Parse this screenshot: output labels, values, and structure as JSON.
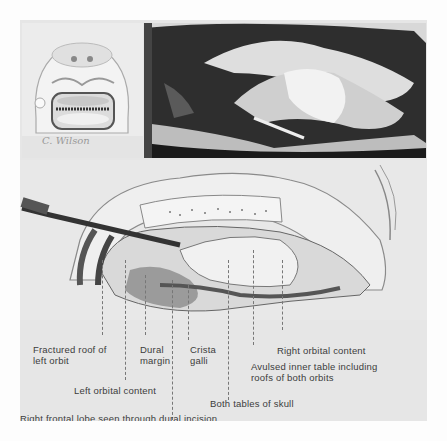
{
  "figure": {
    "type": "medical-surgical-illustration",
    "panels": [
      {
        "id": "inset-skull-model",
        "description": "Drawing of skull/face model viewed from front with open frontal area"
      },
      {
        "id": "operative-photo",
        "description": "Black and white intraoperative photograph of frontal craniotomy"
      },
      {
        "id": "surgical-drawing",
        "description": "Labeled illustration of anterior cranial fossa exposure with retractor"
      }
    ],
    "signature": "C. Wilson",
    "labels": [
      {
        "text": "Fractured roof of\nleft orbit",
        "line1": "Fractured roof of",
        "line2": "left orbit"
      },
      {
        "text": "Dural margin",
        "line1": "Dural",
        "line2": "margin"
      },
      {
        "text": "Crista galli",
        "line1": "Crista",
        "line2": "galli"
      },
      {
        "text": "Right orbital content"
      },
      {
        "text": "Avulsed inner table including roofs of both orbits",
        "line1": "Avulsed inner table including",
        "line2": "roofs of both orbits"
      },
      {
        "text": "Left orbital content"
      },
      {
        "text": "Both tables of skull"
      },
      {
        "text": "Right frontal lobe seen through dural incision"
      }
    ]
  }
}
